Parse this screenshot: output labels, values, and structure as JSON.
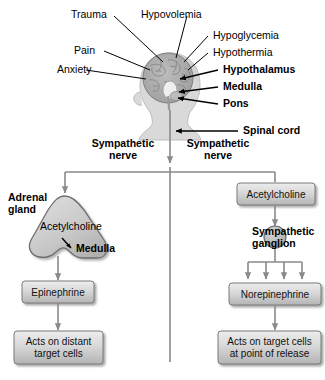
{
  "diagram": {
    "colors": {
      "box_fill_top": "#e6e6e6",
      "box_fill_bottom": "#b9b9b9",
      "box_border": "#7a7a7a",
      "organ_fill": "#cfcfcf",
      "organ_border": "#6e6e6e",
      "line": "#808080",
      "leader": "#000000",
      "head_fill": "#d9d9d9",
      "brain_fill": "#a8a8a8"
    },
    "stimuli": [
      {
        "label": "Trauma",
        "bold": false,
        "arrow": false
      },
      {
        "label": "Hypovolemia",
        "bold": false,
        "arrow": false
      },
      {
        "label": "Pain",
        "bold": false,
        "arrow": false
      },
      {
        "label": "Anxiety",
        "bold": false,
        "arrow": false
      },
      {
        "label": "Hypoglycemia",
        "bold": false,
        "arrow": false
      },
      {
        "label": "Hypothermia",
        "bold": false,
        "arrow": false
      }
    ],
    "brain_structures": [
      {
        "label": "Hypothalamus",
        "bold": true,
        "arrow": true
      },
      {
        "label": "Medulla",
        "bold": true,
        "arrow": true
      },
      {
        "label": "Pons",
        "bold": true,
        "arrow": true
      }
    ],
    "spinal_cord": {
      "label": "Spinal cord",
      "bold": true,
      "arrow": true
    },
    "nerves": [
      {
        "label_line1": "Sympathetic",
        "label_line2": "nerve"
      },
      {
        "label_line1": "Sympathetic",
        "label_line2": "nerve"
      }
    ],
    "adrenal": {
      "organ_label_line1": "Adrenal",
      "organ_label_line2": "gland",
      "neurotransmitter": "Acetylcholine",
      "inner_label": "Medulla"
    },
    "ganglion": {
      "neurotransmitter_box": "Acetylcholine",
      "label_line1": "Sympathetic",
      "label_line2": "ganglion",
      "branch_count": 4
    },
    "left_pathway": {
      "hormone_box": "Epinephrine",
      "outcome_line1": "Acts on distant",
      "outcome_line2": "target cells"
    },
    "right_pathway": {
      "hormone_box": "Norepinephrine",
      "outcome_line1": "Acts on target cells",
      "outcome_line2": "at point of release"
    }
  }
}
